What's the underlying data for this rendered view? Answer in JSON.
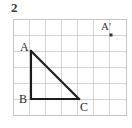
{
  "problem": {
    "number": "2"
  },
  "figure": {
    "background_color": "#ffffff",
    "grid": {
      "columns": 7,
      "rows": 6,
      "cell_size": 16,
      "origin_x": 13,
      "origin_y": 19,
      "line_color": "#cfcfcf",
      "border_color": "#c4c4c4"
    },
    "shape": {
      "name": "triangle ABC",
      "type": "right triangle",
      "stroke_color": "#1c1c1c",
      "stroke_width": 2.1,
      "vertices": [
        {
          "label": "A",
          "x": 31,
          "y": 51,
          "grid_col": 1,
          "grid_row": 2,
          "label_x": 20,
          "label_y": 41
        },
        {
          "label": "B",
          "x": 31,
          "y": 99,
          "grid_col": 1,
          "grid_row": 5,
          "label_x": 19,
          "label_y": 99
        },
        {
          "label": "C",
          "x": 79,
          "y": 99,
          "grid_col": 4,
          "grid_row": 5,
          "label_x": 80,
          "label_y": 101
        }
      ],
      "edges": [
        {
          "name": "AB",
          "from": "A",
          "to": "B"
        },
        {
          "name": "BC",
          "from": "B",
          "to": "C"
        },
        {
          "name": "CA",
          "from": "C",
          "to": "A"
        }
      ]
    },
    "image_point": {
      "label": "A'",
      "x": 111,
      "y": 35,
      "grid_col": 6,
      "grid_row": 1,
      "marker_size": 3,
      "marker_color": "#333333",
      "label_x": 101,
      "label_y": 21
    }
  }
}
